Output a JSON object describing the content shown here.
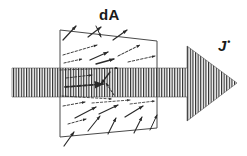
{
  "figure": {
    "background_color": "#ffffff",
    "ink_color": "#1a1a1a",
    "width": 247,
    "height": 156
  },
  "labels": {
    "surface_element": "dA",
    "current_density": "J",
    "current_density_accent": "•"
  },
  "big_arrow": {
    "name": "current-density-arrow",
    "direction": "right",
    "fill_pattern": "vertical-hatch",
    "stripe_color": "#2b2b2b",
    "stripe_width": 1.1,
    "stripe_gap": 1.5,
    "shaft": {
      "x0": 12,
      "x1": 200,
      "y_top": 68,
      "y_bottom": 97
    },
    "head": {
      "x_base": 187,
      "x_tip": 237,
      "y_top": 46,
      "y_bottom": 121,
      "y_tip": 83
    }
  },
  "surface_element": {
    "name": "dA-parallelogram",
    "stroke_color": "#4a4a4a",
    "stroke_width": 1,
    "points": [
      {
        "x": 60,
        "y": 30
      },
      {
        "x": 157,
        "y": 41
      },
      {
        "x": 157,
        "y": 128
      },
      {
        "x": 60,
        "y": 137
      }
    ]
  },
  "velocity_vectors": {
    "name": "charge-carrier-velocity-arrows",
    "count": 28,
    "color": "#2a2a2a",
    "description": "Short arrows showing random drift of charge carriers crossing dA",
    "arrows": [
      {
        "x1": 63,
        "y1": 40,
        "x2": 76,
        "y2": 26,
        "w": 1.2
      },
      {
        "x1": 88,
        "y1": 37,
        "x2": 101,
        "y2": 27,
        "w": 1.2
      },
      {
        "x1": 113,
        "y1": 40,
        "x2": 127,
        "y2": 30,
        "w": 1.2
      },
      {
        "x1": 63,
        "y1": 55,
        "x2": 97,
        "y2": 45,
        "w": 0.9
      },
      {
        "x1": 90,
        "y1": 60,
        "x2": 108,
        "y2": 52,
        "w": 1.3
      },
      {
        "x1": 118,
        "y1": 56,
        "x2": 140,
        "y2": 45,
        "w": 1.0
      },
      {
        "x1": 64,
        "y1": 63,
        "x2": 82,
        "y2": 59,
        "w": 0.9
      },
      {
        "x1": 96,
        "y1": 64,
        "x2": 114,
        "y2": 59,
        "w": 1.3
      },
      {
        "x1": 128,
        "y1": 62,
        "x2": 155,
        "y2": 56,
        "w": 0.9
      },
      {
        "x1": 60,
        "y1": 70,
        "x2": 118,
        "y2": 68,
        "w": 0.8
      },
      {
        "x1": 66,
        "y1": 78,
        "x2": 92,
        "y2": 75,
        "w": 0.9
      },
      {
        "x1": 65,
        "y1": 87,
        "x2": 103,
        "y2": 84,
        "w": 1.8
      },
      {
        "x1": 110,
        "y1": 72,
        "x2": 101,
        "y2": 84,
        "w": 1.3
      },
      {
        "x1": 114,
        "y1": 95,
        "x2": 106,
        "y2": 83,
        "w": 1.0
      },
      {
        "x1": 62,
        "y1": 96,
        "x2": 112,
        "y2": 99,
        "w": 0.8
      },
      {
        "x1": 63,
        "y1": 106,
        "x2": 85,
        "y2": 102,
        "w": 0.9
      },
      {
        "x1": 75,
        "y1": 118,
        "x2": 96,
        "y2": 107,
        "w": 1.2
      },
      {
        "x1": 99,
        "y1": 114,
        "x2": 118,
        "y2": 105,
        "w": 1.2
      },
      {
        "x1": 92,
        "y1": 103,
        "x2": 130,
        "y2": 100,
        "w": 0.8
      },
      {
        "x1": 125,
        "y1": 117,
        "x2": 143,
        "y2": 106,
        "w": 1.2
      },
      {
        "x1": 130,
        "y1": 104,
        "x2": 155,
        "y2": 101,
        "w": 0.8
      },
      {
        "x1": 68,
        "y1": 124,
        "x2": 86,
        "y2": 119,
        "w": 0.9
      },
      {
        "x1": 88,
        "y1": 131,
        "x2": 100,
        "y2": 116,
        "w": 1.1
      },
      {
        "x1": 108,
        "y1": 134,
        "x2": 116,
        "y2": 118,
        "w": 1.1
      },
      {
        "x1": 134,
        "y1": 133,
        "x2": 142,
        "y2": 117,
        "w": 1.1
      },
      {
        "x1": 150,
        "y1": 130,
        "x2": 157,
        "y2": 115,
        "w": 1.0
      },
      {
        "x1": 64,
        "y1": 146,
        "x2": 74,
        "y2": 132,
        "w": 1.2
      },
      {
        "x1": 96,
        "y1": 26,
        "x2": 101,
        "y2": 37,
        "w": 1.0
      }
    ]
  }
}
